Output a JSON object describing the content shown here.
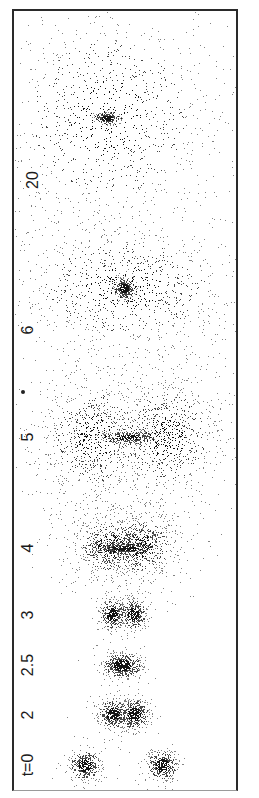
{
  "figure": {
    "frame": {
      "left": 12,
      "top": 9,
      "right": 238,
      "bottom": 791
    }
  },
  "labels": [
    {
      "text": "t=0",
      "x": 28,
      "y": 765
    },
    {
      "text": "2",
      "x": 28,
      "y": 715
    },
    {
      "text": "2.5",
      "x": 28,
      "y": 665
    },
    {
      "text": "3",
      "x": 28,
      "y": 615
    },
    {
      "text": "4",
      "x": 28,
      "y": 548
    },
    {
      "text": "5",
      "x": 28,
      "y": 437
    },
    {
      "text": "6",
      "x": 28,
      "y": 330
    },
    {
      "text": "20",
      "x": 33,
      "y": 180
    }
  ],
  "stray_dot": {
    "x": 23,
    "y": 392
  },
  "chart_data": {
    "type": "scatter",
    "title": "",
    "xlabel": "",
    "ylabel": "",
    "grid": false,
    "legend": "none",
    "tick_labels": [
      "t=0",
      "2",
      "2.5",
      "3",
      "4",
      "5",
      "6",
      "20"
    ],
    "panels": [
      {
        "t": "0",
        "center_y": 765,
        "clumps": [
          {
            "x": 85,
            "y": 765,
            "sx": 7,
            "sy": 7,
            "n": 420,
            "core": 0.9
          },
          {
            "x": 162,
            "y": 765,
            "sx": 7,
            "sy": 7,
            "n": 420,
            "core": 0.9
          }
        ]
      },
      {
        "t": "2",
        "center_y": 714,
        "clumps": [
          {
            "x": 113,
            "y": 714,
            "sx": 7,
            "sy": 7,
            "n": 450,
            "core": 0.9
          },
          {
            "x": 134,
            "y": 714,
            "sx": 7,
            "sy": 7,
            "n": 450,
            "core": 0.9
          }
        ]
      },
      {
        "t": "2.5",
        "center_y": 665,
        "clumps": [
          {
            "x": 122,
            "y": 665,
            "sx": 9,
            "sy": 6,
            "n": 600,
            "core": 0.95
          }
        ]
      },
      {
        "t": "3",
        "center_y": 614,
        "clumps": [
          {
            "x": 112,
            "y": 614,
            "sx": 6,
            "sy": 7,
            "n": 380,
            "core": 0.9
          },
          {
            "x": 133,
            "y": 614,
            "sx": 6,
            "sy": 7,
            "n": 380,
            "core": 0.9
          }
        ]
      },
      {
        "t": "4",
        "center_y": 546,
        "clumps": [
          {
            "x": 110,
            "y": 546,
            "sx": 14,
            "sy": 12,
            "n": 700,
            "core": 0.45
          },
          {
            "x": 140,
            "y": 546,
            "sx": 14,
            "sy": 12,
            "n": 700,
            "core": 0.45
          },
          {
            "x": 125,
            "y": 548,
            "sx": 14,
            "sy": 3,
            "n": 350,
            "core": 0.9
          }
        ]
      },
      {
        "t": "5",
        "center_y": 437,
        "clumps": [
          {
            "x": 95,
            "y": 437,
            "sx": 20,
            "sy": 22,
            "n": 900,
            "core": 0.3
          },
          {
            "x": 165,
            "y": 437,
            "sx": 20,
            "sy": 22,
            "n": 900,
            "core": 0.3
          },
          {
            "x": 128,
            "y": 437,
            "sx": 13,
            "sy": 3,
            "n": 320,
            "core": 0.85
          }
        ]
      },
      {
        "t": "6",
        "center_y": 285,
        "clumps": [
          {
            "x": 125,
            "y": 287,
            "sx": 40,
            "sy": 22,
            "n": 1100,
            "core": 0.25
          },
          {
            "x": 124,
            "y": 288,
            "sx": 5,
            "sy": 5,
            "n": 320,
            "core": 1.0
          }
        ]
      },
      {
        "t": "20",
        "center_y": 115,
        "clumps": [
          {
            "x": 108,
            "y": 118,
            "sx": 38,
            "sy": 38,
            "n": 1200,
            "core": 0.25
          },
          {
            "x": 107,
            "y": 118,
            "sx": 6,
            "sy": 3,
            "n": 220,
            "core": 1.0
          }
        ]
      }
    ]
  }
}
